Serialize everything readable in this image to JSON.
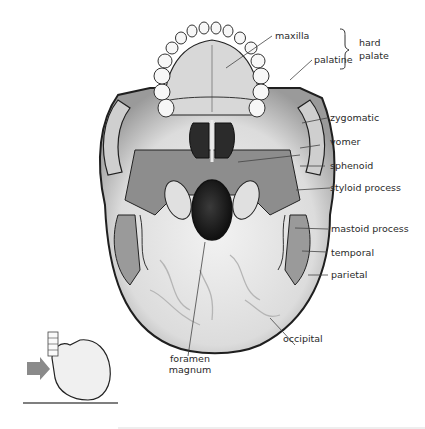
{
  "figure": {
    "view_indicator": {
      "description": "small lateral skull with arrow indicating viewing direction from below",
      "arrow_color": "#8a8a8a",
      "ground_line_color": "#555555"
    },
    "colors": {
      "bone_light": "#e6e6e6",
      "bone_mid": "#bdbdbd",
      "bone_dark": "#6e6e6e",
      "outline": "#1f1f1f",
      "leader": "#444444",
      "text": "#2a2a2a"
    },
    "labels": [
      {
        "id": "maxilla",
        "text": "maxilla"
      },
      {
        "id": "palatine",
        "text": "palatine"
      },
      {
        "id": "hard",
        "text": "hard"
      },
      {
        "id": "palate",
        "text": "palate"
      },
      {
        "id": "zygomatic",
        "text": "zygomatic"
      },
      {
        "id": "vomer",
        "text": "vomer"
      },
      {
        "id": "sphenoid",
        "text": "sphenoid"
      },
      {
        "id": "styloid",
        "text": "styloid process"
      },
      {
        "id": "mastoid",
        "text": "mastoid process"
      },
      {
        "id": "temporal",
        "text": "temporal"
      },
      {
        "id": "parietal",
        "text": "parietal"
      },
      {
        "id": "occipital",
        "text": "occipital"
      },
      {
        "id": "foramen1",
        "text": "foramen"
      },
      {
        "id": "foramen2",
        "text": "magnum"
      }
    ],
    "group_bracket": {
      "label_lines": [
        "hard",
        "palate"
      ],
      "groups": [
        "maxilla",
        "palatine"
      ]
    }
  }
}
